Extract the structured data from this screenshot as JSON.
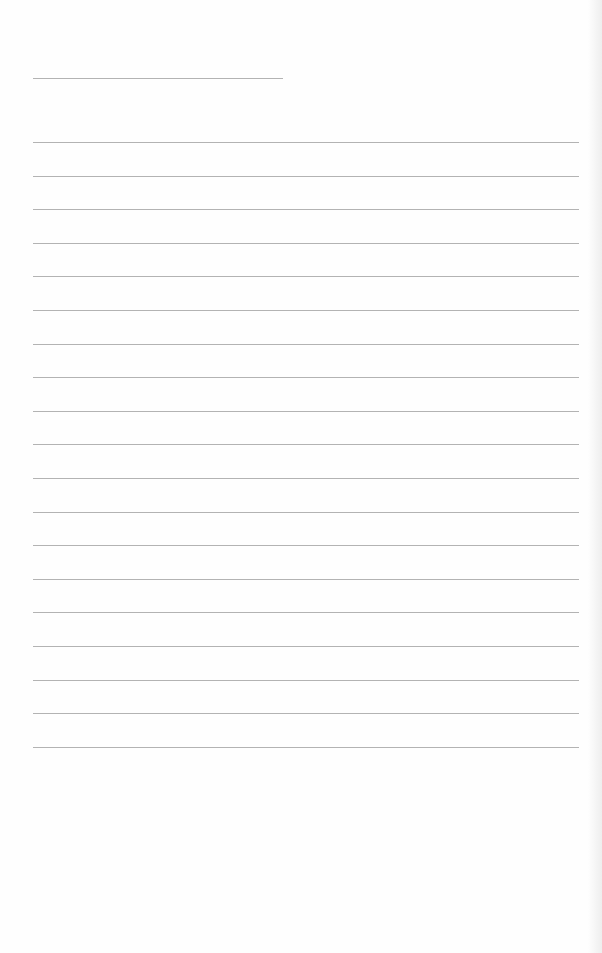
{
  "page": {
    "type": "blank lined sheet",
    "background_color": "#fefefe",
    "rule_color": "#9a9a9a",
    "title_rule": {
      "x": 33,
      "y": 78,
      "width": 250
    },
    "writing_lines": {
      "count": 19,
      "x": 33,
      "width": 546,
      "first_y": 142,
      "spacing": 33.6
    },
    "text": ""
  }
}
